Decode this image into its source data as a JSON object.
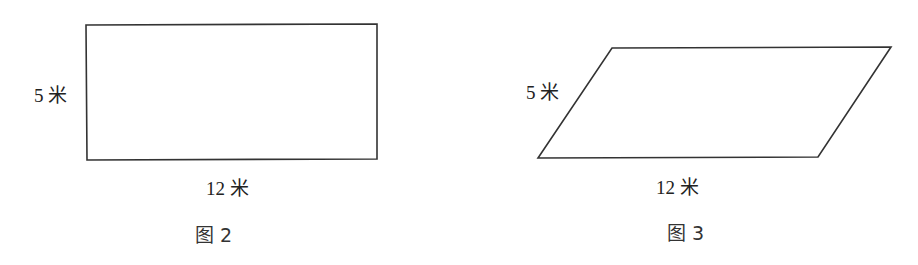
{
  "figures": [
    {
      "caption": "图 2",
      "shape": "rectangle",
      "side_label": "5 米",
      "base_label": "12 米",
      "points": "86,25 377,24 377,159 87,160"
    },
    {
      "caption": "图 3",
      "shape": "parallelogram",
      "side_label": "5 米",
      "base_label": "12 米",
      "points": "612,48 891,47 818,157 538,158"
    }
  ],
  "colors": {
    "stroke": "#333333",
    "text": "#222222",
    "background": "#ffffff"
  }
}
